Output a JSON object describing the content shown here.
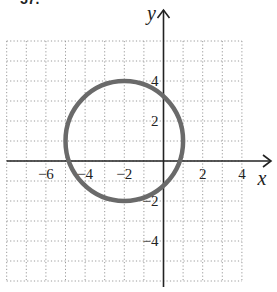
{
  "header_fragment": "57.",
  "chart_data": {
    "type": "line",
    "subtype": "circle",
    "title": "",
    "xlabel": "x",
    "ylabel": "y",
    "xlim": [
      -8,
      4
    ],
    "ylim": [
      -6,
      6
    ],
    "grid": true,
    "grid_spacing": 1,
    "x_tick_labels": [
      {
        "value": -6,
        "label": "−6"
      },
      {
        "value": -4,
        "label": "−4"
      },
      {
        "value": -2,
        "label": "−2"
      },
      {
        "value": 2,
        "label": "2"
      },
      {
        "value": 4,
        "label": "4"
      }
    ],
    "y_tick_labels": [
      {
        "value": 4,
        "label": "4"
      },
      {
        "value": 2,
        "label": "2"
      },
      {
        "value": -2,
        "label": "−2"
      },
      {
        "value": -4,
        "label": "−4"
      }
    ],
    "series": [
      {
        "name": "circle",
        "center": [
          -2,
          1
        ],
        "radius": 3,
        "equation": "(x + 2)^2 + (y - 1)^2 = 9",
        "color": "#6a6a6a"
      }
    ],
    "legend": null
  },
  "layout": {
    "origin_px": [
      163.5,
      161
    ],
    "unit_px_x": 19.6,
    "unit_px_y": 20.0,
    "colors": {
      "axis": "#222222",
      "grid": "#9a9a9a",
      "curve": "#6a6a6a",
      "background": "#ffffff"
    }
  }
}
